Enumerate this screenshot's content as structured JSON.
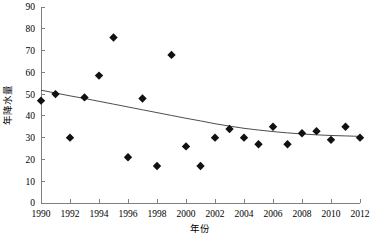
{
  "chart_data": {
    "type": "scatter",
    "title": "",
    "xlabel": "年份",
    "ylabel": "年降水量",
    "xlim": [
      1990,
      2012
    ],
    "ylim": [
      0,
      90
    ],
    "grid": false,
    "legend": null,
    "x_ticks": [
      "1990",
      "1992",
      "1994",
      "1996",
      "1998",
      "2000",
      "2002",
      "2004",
      "2006",
      "2008",
      "2010",
      "2012"
    ],
    "x_tick_values": [
      1990,
      1992,
      1994,
      1996,
      1998,
      2000,
      2002,
      2004,
      2006,
      2008,
      2010,
      2012
    ],
    "y_ticks": [
      "0",
      "10",
      "20",
      "30",
      "40",
      "50",
      "60",
      "70",
      "80",
      "90"
    ],
    "y_tick_values": [
      0,
      10,
      20,
      30,
      40,
      50,
      60,
      70,
      80,
      90
    ],
    "series": [
      {
        "name": "年降水量",
        "marker": "diamond",
        "color": "#111111",
        "x": [
          1990,
          1991,
          1992,
          1993,
          1994,
          1995,
          1996,
          1997,
          1998,
          1999,
          2000,
          2001,
          2002,
          2003,
          2004,
          2005,
          2006,
          2007,
          2008,
          2009,
          2010,
          2011,
          2012
        ],
        "values": [
          47,
          50,
          30,
          48.5,
          58.5,
          76,
          21,
          48,
          17,
          68,
          26,
          17,
          30,
          34,
          30,
          27,
          35,
          27,
          32,
          33,
          29,
          35,
          30
        ]
      },
      {
        "name": "趋势线",
        "type": "line",
        "color": "#4d4d4d",
        "x": [
          1990,
          1991,
          1992,
          1993,
          1994,
          1995,
          1996,
          1997,
          1998,
          1999,
          2000,
          2001,
          2002,
          2003,
          2004,
          2005,
          2006,
          2007,
          2008,
          2009,
          2010,
          2011,
          2012
        ],
        "values": [
          51.8,
          50.5,
          49.2,
          48.0,
          46.7,
          45.4,
          44.1,
          42.8,
          41.5,
          40.2,
          38.9,
          37.7,
          36.4,
          35.3,
          34.3,
          33.5,
          32.8,
          32.2,
          31.7,
          31.3,
          31.0,
          30.8,
          30.6
        ]
      }
    ]
  },
  "axes": {
    "x_title": "年份",
    "y_title": "年降水量"
  }
}
